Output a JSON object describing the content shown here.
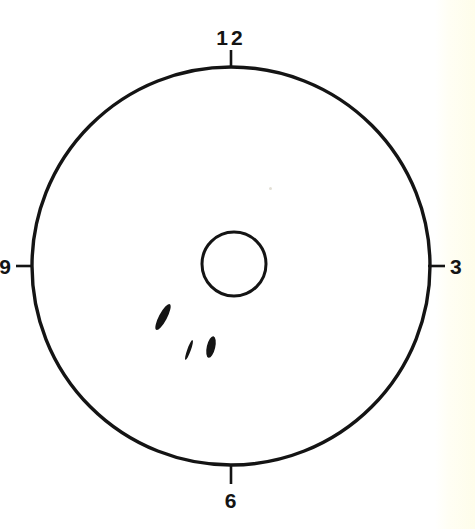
{
  "page": {
    "width": 475,
    "height": 529,
    "background_color": "#ffffff",
    "ink_color": "#141414",
    "scan_edge_color": "#fefdea"
  },
  "diagram": {
    "type": "clock-face-schematic",
    "outer_circle": {
      "name": "outer-boundary-circle",
      "center_x": 231,
      "center_y": 266,
      "radius": 199,
      "stroke_width": 3.4,
      "fill": "none"
    },
    "inner_circle": {
      "name": "inner-circle",
      "center_x": 234,
      "center_y": 264,
      "radius": 32,
      "stroke_width": 3.0,
      "fill": "none"
    },
    "clock_positions": [
      {
        "id": "pos-12",
        "label": "12",
        "angle_deg": 0,
        "tick": {
          "x1": 231,
          "y1": 67,
          "x2": 231,
          "y2": 50
        },
        "label_x": 231,
        "label_y": 45,
        "label_anchor": "middle",
        "label_baseline": "baseline"
      },
      {
        "id": "pos-3",
        "label": "3",
        "angle_deg": 90,
        "tick": {
          "x1": 428,
          "y1": 266,
          "x2": 445,
          "y2": 266
        },
        "label_x": 450,
        "label_y": 274,
        "label_anchor": "start",
        "label_baseline": "baseline"
      },
      {
        "id": "pos-6",
        "label": "6",
        "angle_deg": 180,
        "tick": {
          "x1": 231,
          "y1": 466,
          "x2": 231,
          "y2": 484
        },
        "label_x": 231,
        "label_y": 508,
        "label_anchor": "middle",
        "label_baseline": "baseline"
      },
      {
        "id": "pos-9",
        "label": "9",
        "angle_deg": 270,
        "tick": {
          "x1": 33,
          "y1": 266,
          "x2": 16,
          "y2": 266
        },
        "label_x": 12,
        "label_y": 274,
        "label_anchor": "end",
        "label_baseline": "baseline"
      }
    ],
    "marks": [
      {
        "id": "mark-1",
        "name": "lesion-mark-large",
        "shape": "ellipse",
        "center_x": 163,
        "center_y": 317,
        "radius_x": 4.0,
        "radius_y": 14.5,
        "rotation_deg": 28,
        "fill": "#141414"
      },
      {
        "id": "mark-2",
        "name": "lesion-mark-thin",
        "shape": "ellipse",
        "center_x": 189,
        "center_y": 350,
        "radius_x": 1.8,
        "radius_y": 10.5,
        "rotation_deg": 20,
        "fill": "#141414"
      },
      {
        "id": "mark-3",
        "name": "lesion-mark-small",
        "shape": "ellipse",
        "center_x": 211,
        "center_y": 347,
        "radius_x": 4.2,
        "radius_y": 11.0,
        "rotation_deg": 13,
        "fill": "#141414"
      }
    ],
    "artifacts": [
      {
        "id": "speck-1",
        "name": "scan-speck",
        "x": 269,
        "y": 187,
        "size": 3,
        "color": "#e3e0d6"
      }
    ]
  }
}
